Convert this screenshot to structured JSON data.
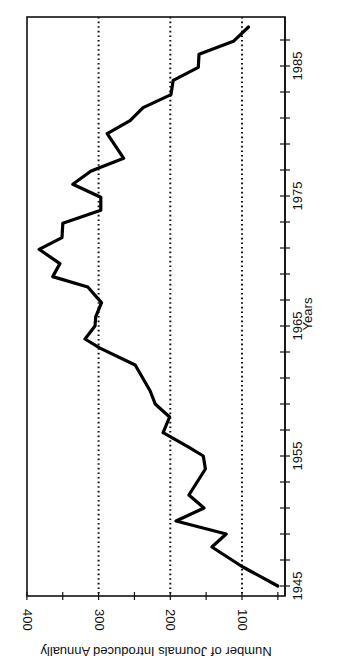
{
  "chart_data": {
    "type": "line",
    "title": "",
    "xlabel": "Years",
    "ylabel": "Number of Journals Introduced Annually",
    "orientation": "rotated-90-clockwise",
    "xlim": [
      1945,
      1988
    ],
    "ylim": [
      40,
      400
    ],
    "x_ticks": [
      1945,
      1955,
      1965,
      1975,
      1985
    ],
    "x_minor_tick_step": 2,
    "y_ticks": [
      100,
      200,
      300,
      400
    ],
    "y_minor_tick_step": 50,
    "gridlines": {
      "axis": "y",
      "values": [
        100,
        200,
        300
      ],
      "style": "dotted"
    },
    "legend": null,
    "series": [
      {
        "name": "Journals introduced",
        "color": "#000000",
        "x": [
          1945,
          1946.5,
          1948,
          1949,
          1950,
          1951,
          1952,
          1954,
          1955,
          1955.7,
          1956.8,
          1958,
          1959,
          1960,
          1962,
          1963.3,
          1964,
          1965,
          1965.7,
          1966.8,
          1968,
          1968.8,
          1969.8,
          1970.9,
          1971.8,
          1972.9,
          1973.9,
          1974.9,
          1975.9,
          1976.9,
          1977.2,
          1977.9,
          1979.8,
          1980.8,
          1981.8,
          1982.8,
          1983.9,
          1984.9,
          1985.9,
          1986.9,
          1988
        ],
        "values": [
          50,
          100,
          142,
          122,
          192,
          153,
          174,
          151,
          154,
          175,
          210,
          201,
          221,
          228,
          249,
          298,
          319,
          305,
          304,
          296,
          315,
          364,
          354,
          383,
          351,
          350,
          297,
          297,
          336,
          311,
          298,
          265,
          288,
          256,
          238,
          199,
          196,
          161,
          160,
          112,
          91
        ]
      }
    ]
  },
  "labels": {
    "xlabel": "Years",
    "ylabel": "Number of Journals Introduced Annually",
    "x_tick_labels": [
      "1945",
      "1955",
      "1965",
      "1975",
      "1985"
    ],
    "y_tick_labels": [
      "100",
      "200",
      "300",
      "400"
    ]
  }
}
